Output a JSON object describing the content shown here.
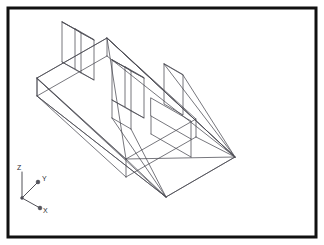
{
  "document": {
    "title": "Isometric Wireframe CAD View",
    "background_color": "#ffffff",
    "border_color": "#111111",
    "line_color": "#4a4a52"
  },
  "frame": {
    "x": 8,
    "y": 8,
    "width": 308,
    "height": 229,
    "stroke_width": 3
  },
  "ucs_icon": {
    "name": "ucs-axis-tripod",
    "origin": {
      "x": 22,
      "y": 198
    },
    "axes": [
      {
        "id": "z-axis",
        "label": "Z",
        "tip": {
          "x": 22,
          "y": 172
        },
        "label_pos": {
          "x": 17,
          "y": 170
        },
        "arrow": "none"
      },
      {
        "id": "y-axis",
        "label": "Y",
        "tip": {
          "x": 38,
          "y": 182
        },
        "label_pos": {
          "x": 42,
          "y": 181
        },
        "arrow": "dot"
      },
      {
        "id": "x-axis",
        "label": "X",
        "tip": {
          "x": 40,
          "y": 208
        },
        "label_pos": {
          "x": 43,
          "y": 213
        },
        "arrow": "dot"
      }
    ]
  },
  "geometry": {
    "description": "Isometric wireframe of a ramp/wedge base carrying a long rib with transverse plates",
    "projection": "isometric",
    "units": "screen-pixels",
    "polylines": [
      {
        "name": "wedge-base-bottom",
        "closed": true,
        "points": "37,78 107,38 235,157 166,197"
      },
      {
        "name": "wedge-ramp-face",
        "closed": false,
        "points": "37,78 37,96 166,197"
      },
      {
        "name": "wedge-left-end-vertical",
        "closed": false,
        "points": "37,96 107,56"
      },
      {
        "name": "wedge-top-ridge",
        "closed": false,
        "points": "107,38 107,56"
      },
      {
        "name": "wedge-upper-slope-left",
        "closed": false,
        "points": "37,96 166,197"
      },
      {
        "name": "wedge-upper-slope-right",
        "closed": false,
        "points": "107,56 235,157"
      },
      {
        "name": "wedge-right-edge-a",
        "closed": false,
        "points": "107,38 235,157"
      },
      {
        "name": "wedge-right-edge-b",
        "closed": false,
        "points": "166,197 235,157"
      },
      {
        "name": "rib-top-face",
        "closed": true,
        "points": "37,78 107,38 196,119 126,159"
      },
      {
        "name": "rib-front-face-left",
        "closed": false,
        "points": "37,78 37,96"
      },
      {
        "name": "rib-front-lower-edge",
        "closed": false,
        "points": "37,96 126,177"
      },
      {
        "name": "rib-front-vertical-right",
        "closed": false,
        "points": "126,159 126,177"
      },
      {
        "name": "rib-bottom-edge",
        "closed": false,
        "points": "126,177 196,137"
      },
      {
        "name": "rib-right-vertical",
        "closed": false,
        "points": "196,119 196,137"
      },
      {
        "name": "rib-inner-edge-top",
        "closed": false,
        "points": "107,38 126,159"
      },
      {
        "name": "rib-inner-edge-long",
        "closed": false,
        "points": "37,78 126,159"
      },
      {
        "name": "plate-left-outer-quad",
        "closed": true,
        "points": "62,22 62,62 81,73 81,33"
      },
      {
        "name": "plate-left-inner-quad",
        "closed": true,
        "points": "75,29 75,69 94,80 94,40"
      },
      {
        "name": "plate-left-connector-top",
        "closed": false,
        "points": "62,22 75,29"
      },
      {
        "name": "plate-left-connector-mid",
        "closed": false,
        "points": "81,33 94,40"
      },
      {
        "name": "plate-left-connector-bot",
        "closed": false,
        "points": "62,62 75,69"
      },
      {
        "name": "plate-left-connector-low",
        "closed": false,
        "points": "81,73 94,80"
      },
      {
        "name": "plate-left-diag-a",
        "closed": false,
        "points": "62,22 94,40"
      },
      {
        "name": "plate-left-diag-b",
        "closed": false,
        "points": "75,29 81,33"
      },
      {
        "name": "plate-mid-a-quad",
        "closed": true,
        "points": "112,60 112,100 131,111 131,71"
      },
      {
        "name": "plate-mid-b-quad",
        "closed": true,
        "points": "125,67 125,107 144,118 144,78"
      },
      {
        "name": "plate-mid-connector-top",
        "closed": false,
        "points": "112,60 125,67"
      },
      {
        "name": "plate-mid-connector-r",
        "closed": false,
        "points": "131,71 144,78"
      },
      {
        "name": "plate-mid-connector-bot",
        "closed": false,
        "points": "112,100 125,107"
      },
      {
        "name": "plate-mid-connector-low",
        "closed": false,
        "points": "131,111 144,118"
      },
      {
        "name": "plate-mid-cross-a",
        "closed": false,
        "points": "112,60 144,78"
      },
      {
        "name": "plate-mid-cross-b",
        "closed": false,
        "points": "125,67 131,71"
      },
      {
        "name": "plate-mid-drop-left",
        "closed": false,
        "points": "112,100 112,118"
      },
      {
        "name": "plate-mid-drop-right",
        "closed": false,
        "points": "131,111 131,129"
      },
      {
        "name": "plate-mid-drop-base",
        "closed": false,
        "points": "112,118 131,129"
      },
      {
        "name": "plate-right-quad",
        "closed": true,
        "points": "164,64 164,104 183,115 183,75"
      },
      {
        "name": "plate-right-edge-back",
        "closed": false,
        "points": "164,64 183,75"
      },
      {
        "name": "slab-right-top",
        "closed": true,
        "points": "151,98 191,121 191,139 151,116"
      },
      {
        "name": "slab-right-front",
        "closed": false,
        "points": "151,116 151,134"
      },
      {
        "name": "slab-right-front-bottom",
        "closed": false,
        "points": "151,134 191,157"
      },
      {
        "name": "slab-right-end",
        "closed": false,
        "points": "191,139 191,157"
      },
      {
        "name": "tie-line-a",
        "closed": false,
        "points": "107,38 235,157"
      },
      {
        "name": "tie-line-b",
        "closed": false,
        "points": "126,159 166,197"
      },
      {
        "name": "tie-line-c",
        "closed": false,
        "points": "126,159 235,157"
      },
      {
        "name": "tie-line-d",
        "closed": false,
        "points": "112,118 166,197"
      },
      {
        "name": "tie-line-e",
        "closed": false,
        "points": "183,75 235,157"
      },
      {
        "name": "tie-line-f",
        "closed": false,
        "points": "164,64 235,157"
      },
      {
        "name": "tie-line-g",
        "closed": false,
        "points": "196,137 235,157"
      },
      {
        "name": "tie-line-h",
        "closed": false,
        "points": "131,129 166,197"
      }
    ]
  }
}
